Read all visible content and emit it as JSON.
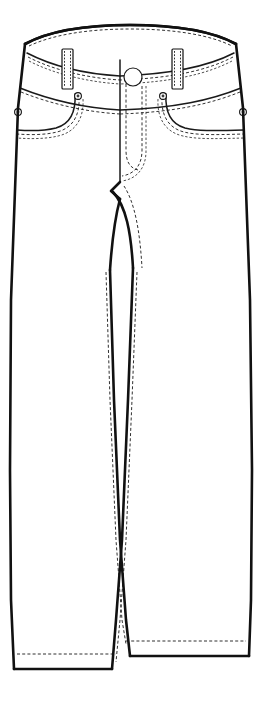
{
  "illustration": {
    "subject": "women-jeans-technical-flat",
    "view": "front",
    "title": "Jeans Front Technical Flat",
    "background_color": "#ffffff",
    "ink_color": "#111111",
    "stitch_color": "#1a1a1a",
    "canvas": {
      "width": 261,
      "height": 711
    }
  },
  "components": {
    "waistband": {
      "name": "waistband",
      "top_center_y": 28,
      "bottom_center_y": 92,
      "stitch_rows": 2
    },
    "belt_loops": [
      {
        "name": "belt-loop-left",
        "x": 62,
        "y_top": 49,
        "width": 11,
        "height": 40
      },
      {
        "name": "belt-loop-right",
        "x": 172,
        "y_top": 49,
        "width": 11,
        "height": 40
      }
    ],
    "button": {
      "name": "waist-button",
      "cx": 133,
      "cy": 77,
      "r": 9
    },
    "fly": {
      "name": "center-front-fly",
      "x": 120,
      "y_top": 60,
      "y_bottom": 182,
      "j_stitch": true
    },
    "pockets": [
      {
        "name": "front-pocket-left",
        "side": "left",
        "stitch_rows": 2
      },
      {
        "name": "front-pocket-right",
        "side": "right",
        "stitch_rows": 2
      }
    ],
    "rivets": [
      {
        "name": "rivet-pocket-left-inner",
        "cx": 78,
        "cy": 96,
        "r": 3.4
      },
      {
        "name": "rivet-pocket-right-inner",
        "cx": 163,
        "cy": 96,
        "r": 3.4
      },
      {
        "name": "rivet-pocket-left-outer",
        "cx": 18,
        "cy": 112,
        "r": 3.4
      },
      {
        "name": "rivet-pocket-right-outer",
        "cx": 243,
        "cy": 112,
        "r": 3.4
      }
    ],
    "crotch": {
      "name": "crotch-point",
      "x": 120,
      "y": 185
    },
    "legs": [
      {
        "name": "leg-left",
        "hem_y": 668,
        "hem_stitch": true,
        "inseam_stitch": true
      },
      {
        "name": "leg-right",
        "hem_y": 655,
        "hem_stitch": true,
        "inseam_stitch": true
      }
    ]
  }
}
